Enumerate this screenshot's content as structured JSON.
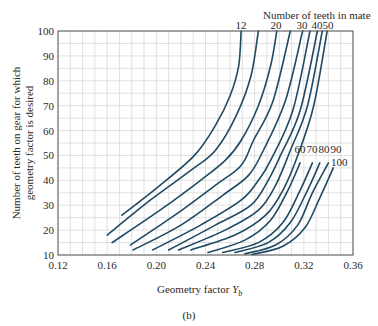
{
  "chart_data": {
    "type": "line",
    "title": "",
    "legend_title": "Number of teeth in mate",
    "xlabel": "Geometry factor Y_b",
    "xlabel_main": "Geometry factor ",
    "xlabel_symbol": "Y",
    "xlabel_sub": "b",
    "ylabel_line1": "Number of teeth on gear for which",
    "ylabel_line2": "geometry factor is desired",
    "xlim": [
      0.12,
      0.36
    ],
    "ylim": [
      10,
      100
    ],
    "xticks": [
      "0.12",
      "0.16",
      "0.20",
      "0.24",
      "0.28",
      "0.32",
      "0.36"
    ],
    "yticks": [
      "10",
      "20",
      "30",
      "40",
      "50",
      "60",
      "70",
      "80",
      "90",
      "100"
    ],
    "grid": true,
    "top_labels": [
      "12",
      "20",
      "30",
      "40",
      "50"
    ],
    "right_labels": [
      "60",
      "70",
      "80",
      "90"
    ],
    "right_label_100": "100",
    "series": [
      {
        "name": "12",
        "points": [
          [
            0.172,
            26
          ],
          [
            0.203,
            38
          ],
          [
            0.231,
            50
          ],
          [
            0.248,
            62
          ],
          [
            0.26,
            74
          ],
          [
            0.267,
            86
          ],
          [
            0.269,
            100
          ]
        ]
      },
      {
        "name": "15",
        "points": [
          [
            0.16,
            18
          ],
          [
            0.195,
            32
          ],
          [
            0.228,
            44
          ],
          [
            0.248,
            52
          ],
          [
            0.265,
            66
          ],
          [
            0.277,
            82
          ],
          [
            0.283,
            100
          ]
        ]
      },
      {
        "name": "20",
        "points": [
          [
            0.164,
            15
          ],
          [
            0.203,
            28
          ],
          [
            0.236,
            40
          ],
          [
            0.256,
            48
          ],
          [
            0.269,
            56
          ],
          [
            0.283,
            70
          ],
          [
            0.293,
            86
          ],
          [
            0.298,
            100
          ]
        ]
      },
      {
        "name": "25",
        "points": [
          [
            0.179,
            14
          ],
          [
            0.215,
            26
          ],
          [
            0.248,
            38
          ],
          [
            0.269,
            46
          ],
          [
            0.279,
            56
          ],
          [
            0.295,
            72
          ],
          [
            0.309,
            100
          ]
        ]
      },
      {
        "name": "30",
        "points": [
          [
            0.181,
            12
          ],
          [
            0.22,
            22
          ],
          [
            0.254,
            34
          ],
          [
            0.275,
            42
          ],
          [
            0.287,
            52
          ],
          [
            0.305,
            72
          ],
          [
            0.319,
            100
          ]
        ]
      },
      {
        "name": "35",
        "points": [
          [
            0.197,
            12
          ],
          [
            0.236,
            22
          ],
          [
            0.269,
            32
          ],
          [
            0.283,
            40
          ],
          [
            0.293,
            48
          ],
          [
            0.311,
            68
          ],
          [
            0.325,
            100
          ]
        ]
      },
      {
        "name": "40",
        "points": [
          [
            0.21,
            12
          ],
          [
            0.248,
            22
          ],
          [
            0.277,
            30
          ],
          [
            0.291,
            40
          ],
          [
            0.301,
            50
          ],
          [
            0.317,
            68
          ],
          [
            0.331,
            100
          ]
        ]
      },
      {
        "name": "45",
        "points": [
          [
            0.218,
            12
          ],
          [
            0.256,
            20
          ],
          [
            0.283,
            28
          ],
          [
            0.297,
            38
          ],
          [
            0.309,
            52
          ],
          [
            0.323,
            70
          ],
          [
            0.335,
            100
          ]
        ]
      },
      {
        "name": "50",
        "points": [
          [
            0.228,
            12
          ],
          [
            0.264,
            18
          ],
          [
            0.289,
            26
          ],
          [
            0.303,
            36
          ],
          [
            0.315,
            50
          ],
          [
            0.328,
            70
          ],
          [
            0.339,
            100
          ]
        ]
      },
      {
        "name": "60",
        "points": [
          [
            0.242,
            11
          ],
          [
            0.272,
            16
          ],
          [
            0.293,
            24
          ],
          [
            0.307,
            36
          ],
          [
            0.317,
            47
          ]
        ]
      },
      {
        "name": "70",
        "points": [
          [
            0.254,
            11
          ],
          [
            0.283,
            15
          ],
          [
            0.303,
            23
          ],
          [
            0.317,
            36
          ],
          [
            0.327,
            47
          ]
        ]
      },
      {
        "name": "80",
        "points": [
          [
            0.264,
            11
          ],
          [
            0.291,
            15
          ],
          [
            0.309,
            23
          ],
          [
            0.323,
            36
          ],
          [
            0.333,
            47
          ]
        ]
      },
      {
        "name": "90",
        "points": [
          [
            0.272,
            10.5
          ],
          [
            0.297,
            14
          ],
          [
            0.315,
            22
          ],
          [
            0.327,
            35
          ],
          [
            0.34,
            47
          ]
        ]
      },
      {
        "name": "100",
        "points": [
          [
            0.278,
            10.2
          ],
          [
            0.303,
            13.5
          ],
          [
            0.321,
            21
          ],
          [
            0.333,
            33
          ],
          [
            0.344,
            45
          ]
        ]
      }
    ]
  },
  "caption": "(b)"
}
